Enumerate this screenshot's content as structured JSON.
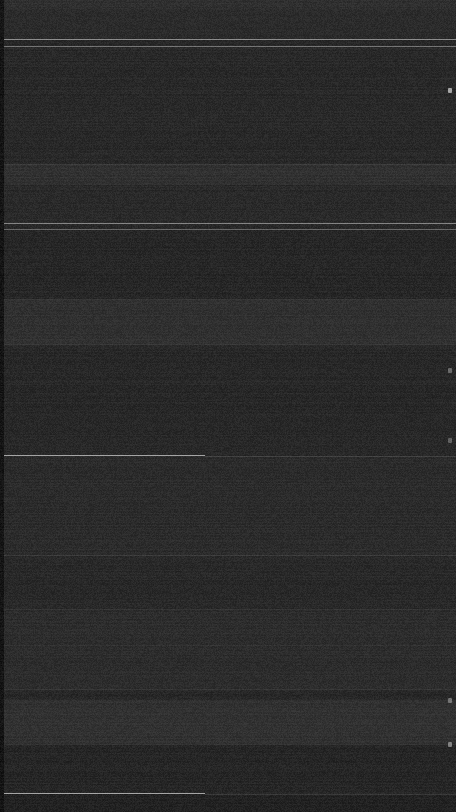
{
  "capture": {
    "width": 456,
    "height": 812,
    "orientation": "portrait",
    "theme": "dark",
    "legibility_note": "Screenshot is near-black and heavily noise-dominated; no text, icon glyph or numeric value is resolvable at any zoom level. Only tonal bands, hairline dividers and right-edge indicator dots are observable."
  },
  "colors": {
    "screen_background": "#1c1c1c",
    "left_gutter": "#080808",
    "status_bar": "#242424",
    "band_light": "#262626",
    "band_mid": "#212121",
    "band_dark": "#161616",
    "divider_bright": "#9a9a9a",
    "divider_medium": "#585858",
    "divider_faint": "#333333",
    "edge_marker": "#b8b8b8"
  },
  "status_bar": {
    "name": "status-bar",
    "top": 0,
    "height": 9
  },
  "left_gutter": {
    "name": "left-gutter",
    "width": 4
  },
  "bands": [
    {
      "name": "header-band",
      "top": 9,
      "height": 30,
      "color": "#1f1f1f"
    },
    {
      "name": "content-band-1",
      "top": 47,
      "height": 118,
      "color": "#1d1d1d"
    },
    {
      "name": "content-band-2",
      "top": 165,
      "height": 20,
      "color": "#262626"
    },
    {
      "name": "content-band-3",
      "top": 185,
      "height": 38,
      "color": "#1e1e1e"
    },
    {
      "name": "content-band-4",
      "top": 230,
      "height": 70,
      "color": "#1b1b1b"
    },
    {
      "name": "content-band-5",
      "top": 300,
      "height": 45,
      "color": "#252525"
    },
    {
      "name": "content-band-6",
      "top": 345,
      "height": 110,
      "color": "#1c1c1c"
    },
    {
      "name": "content-band-7",
      "top": 456,
      "height": 99,
      "color": "#202020"
    },
    {
      "name": "content-band-8",
      "top": 556,
      "height": 54,
      "color": "#1d1d1d"
    },
    {
      "name": "content-band-9",
      "top": 610,
      "height": 80,
      "color": "#212121"
    },
    {
      "name": "content-band-10",
      "top": 700,
      "height": 45,
      "color": "#262626"
    },
    {
      "name": "content-band-11",
      "top": 745,
      "height": 48,
      "color": "#1a1a1a"
    },
    {
      "name": "content-band-12",
      "top": 794,
      "height": 18,
      "color": "#161616"
    }
  ],
  "dividers": [
    {
      "name": "divider-header-top",
      "top": 39,
      "left": 0,
      "width": 456,
      "color": "#9a9a9a",
      "opacity": 0.85
    },
    {
      "name": "divider-header-bottom",
      "top": 46,
      "left": 0,
      "width": 456,
      "color": "#8a8a8a",
      "opacity": 0.75
    },
    {
      "name": "divider-row-1",
      "top": 164,
      "left": 4,
      "width": 452,
      "color": "#3a3a3a",
      "opacity": 0.8
    },
    {
      "name": "divider-row-2",
      "top": 223,
      "left": 0,
      "width": 456,
      "color": "#9a9a9a",
      "opacity": 0.8
    },
    {
      "name": "divider-row-3",
      "top": 229,
      "left": 0,
      "width": 456,
      "color": "#7d7d7d",
      "opacity": 0.7
    },
    {
      "name": "divider-row-4",
      "top": 299,
      "left": 4,
      "width": 452,
      "color": "#343434",
      "opacity": 0.8
    },
    {
      "name": "divider-row-5",
      "top": 344,
      "left": 4,
      "width": 452,
      "color": "#303030",
      "opacity": 0.8
    },
    {
      "name": "divider-section-main",
      "top": 455,
      "left": 0,
      "width": 205,
      "color": "#b0b0b0",
      "opacity": 0.9
    },
    {
      "name": "divider-section-tail",
      "top": 456,
      "left": 205,
      "width": 251,
      "color": "#4a4a4a",
      "opacity": 0.6
    },
    {
      "name": "divider-row-6",
      "top": 555,
      "left": 4,
      "width": 452,
      "color": "#3a3a3a",
      "opacity": 0.7
    },
    {
      "name": "divider-row-7",
      "top": 609,
      "left": 4,
      "width": 452,
      "color": "#2e2e2e",
      "opacity": 0.7
    },
    {
      "name": "divider-row-8",
      "top": 645,
      "left": 4,
      "width": 452,
      "color": "#2c2c2c",
      "opacity": 0.6
    },
    {
      "name": "divider-row-9",
      "top": 689,
      "left": 4,
      "width": 452,
      "color": "#343434",
      "opacity": 0.7
    },
    {
      "name": "divider-row-10",
      "top": 744,
      "left": 4,
      "width": 452,
      "color": "#2e2e2e",
      "opacity": 0.6
    },
    {
      "name": "divider-footer-main",
      "top": 793,
      "left": 0,
      "width": 205,
      "color": "#b0b0b0",
      "opacity": 0.9
    },
    {
      "name": "divider-footer-tail",
      "top": 794,
      "left": 205,
      "width": 251,
      "color": "#4a4a4a",
      "opacity": 0.55
    }
  ],
  "edge_markers": [
    {
      "name": "edge-indicator-1",
      "top": 88,
      "right": 4,
      "opacity": 0.85
    },
    {
      "name": "edge-indicator-2",
      "top": 368,
      "right": 4,
      "opacity": 0.45
    },
    {
      "name": "edge-indicator-3",
      "top": 438,
      "right": 4,
      "opacity": 0.4
    },
    {
      "name": "edge-indicator-4",
      "top": 698,
      "right": 4,
      "opacity": 0.5
    },
    {
      "name": "edge-indicator-5",
      "top": 742,
      "right": 4,
      "opacity": 0.6
    }
  ]
}
